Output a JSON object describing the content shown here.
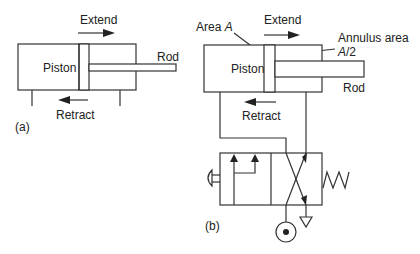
{
  "diagram_a": {
    "label": "(a)",
    "piston_label": "Piston",
    "rod_label": "Rod",
    "extend_label": "Extend",
    "retract_label": "Retract"
  },
  "diagram_b": {
    "label": "(b)",
    "piston_label": "Piston",
    "rod_label": "Rod",
    "extend_label": "Extend",
    "retract_label": "Retract",
    "area_label_prefix": "Area ",
    "area_label_var": "A",
    "annulus_label": "Annulus area",
    "annulus_value_var": "A",
    "annulus_value_rest": "/2"
  },
  "colors": {
    "line": "#333333",
    "background": "#ffffff"
  }
}
